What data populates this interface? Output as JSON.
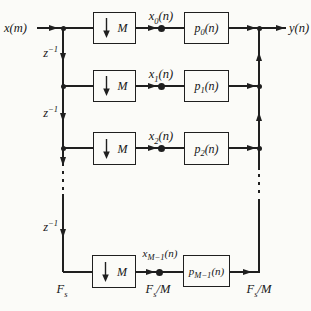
{
  "diagram": {
    "colors": {
      "line": "#1f1f1f",
      "background": "#fbfbf8"
    },
    "input_label": {
      "base": "x",
      "suffix": "(m)"
    },
    "output_label": {
      "base": "y",
      "suffix": "(n)"
    },
    "delays": [
      {
        "base": "z",
        "sup": "−1"
      },
      {
        "base": "z",
        "sup": "−1"
      },
      {
        "base": "z",
        "sup": "−1"
      }
    ],
    "downsampler": {
      "arrow_icon": "down-arrow",
      "factor": "M"
    },
    "rows": [
      {
        "signal": {
          "base": "x",
          "sub": "0",
          "suffix": "(n)"
        },
        "filter": {
          "base": "p",
          "sub": "0",
          "suffix": "(n)"
        }
      },
      {
        "signal": {
          "base": "x",
          "sub": "1",
          "suffix": "(n)"
        },
        "filter": {
          "base": "p",
          "sub": "1",
          "suffix": "(n)"
        }
      },
      {
        "signal": {
          "base": "x",
          "sub": "2",
          "suffix": "(n)"
        },
        "filter": {
          "base": "p",
          "sub": "2",
          "suffix": "(n)"
        }
      },
      {
        "signal": {
          "base": "x",
          "sub": "M−1",
          "suffix": "(n)"
        },
        "filter": {
          "base": "p",
          "sub": "M−1",
          "suffix": "(n)"
        }
      }
    ],
    "sample_rates": {
      "input": {
        "base": "F",
        "sub": "s",
        "suffix": ""
      },
      "decimated": {
        "base": "F",
        "sub": "s",
        "suffix": "/M"
      },
      "output": {
        "base": "F",
        "sub": "s",
        "suffix": "/M"
      }
    }
  }
}
